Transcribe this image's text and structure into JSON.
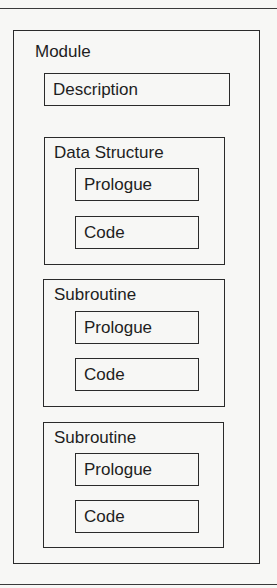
{
  "diagram": {
    "module": {
      "label": "Module",
      "description": "Description",
      "sections": [
        {
          "label": "Data Structure",
          "items": [
            "Prologue",
            "Code"
          ]
        },
        {
          "label": "Subroutine",
          "items": [
            "Prologue",
            "Code"
          ]
        },
        {
          "label": "Subroutine",
          "items": [
            "Prologue",
            "Code"
          ]
        }
      ]
    }
  }
}
